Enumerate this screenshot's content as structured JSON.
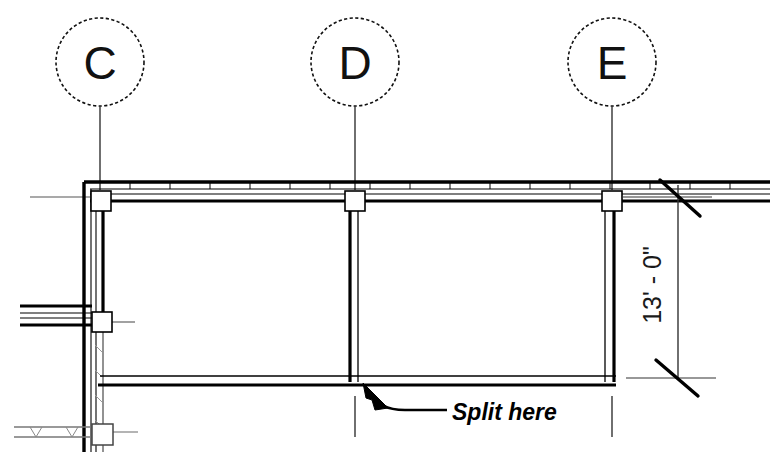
{
  "drawing": {
    "type": "architectural-floor-plan",
    "background_color": "#ffffff",
    "line_color": "#000000",
    "grid_bubbles": [
      {
        "label": "C",
        "cx": 100,
        "cy": 62,
        "r": 44,
        "leader_x": 100,
        "leader_top": 106,
        "leader_bottom": 190
      },
      {
        "label": "D",
        "cx": 355,
        "cy": 62,
        "r": 44,
        "leader_x": 355,
        "leader_top": 106,
        "leader_bottom": 190
      },
      {
        "label": "E",
        "cx": 612,
        "cy": 62,
        "r": 44,
        "leader_x": 612,
        "leader_top": 106,
        "leader_bottom": 190
      }
    ],
    "dimension": {
      "value": "13' - 0\"",
      "orientation": "vertical",
      "line_x": 678,
      "line_top": 185,
      "line_bottom": 378,
      "text_x": 652,
      "text_y": 285,
      "tick_style": "slash"
    },
    "annotation": {
      "text": "Split here",
      "text_x": 452,
      "text_y": 412,
      "leader_from_x": 447,
      "leader_to_x": 368,
      "leader_to_y": 388,
      "arrow_style": "solid-filled"
    },
    "walls": {
      "top_wall_y": 186,
      "bottom_wall_y": 380,
      "left_wall_x": 90,
      "right_wall_x": 612,
      "mid_wall_x": 355,
      "stub_wall_y": 312,
      "lower_leg_bottom_y": 452
    },
    "columns": [
      {
        "grid": "C",
        "x": 100,
        "y": 200
      },
      {
        "grid": "D",
        "x": 355,
        "y": 200
      },
      {
        "grid": "E",
        "x": 612,
        "y": 200
      },
      {
        "grid": "C-stub",
        "x": 100,
        "y": 322
      },
      {
        "grid": "C-bottom",
        "x": 100,
        "y": 437
      }
    ]
  }
}
